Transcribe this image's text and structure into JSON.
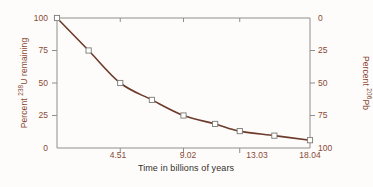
{
  "chart_data": {
    "type": "line",
    "title": "",
    "xlabel": "Time in billions of years",
    "ylabel_left": "Percent 238U remaining",
    "ylabel_right": "Percent 206Pb",
    "x": [
      0,
      2.255,
      4.51,
      6.765,
      9.02,
      11.275,
      13.03,
      15.5,
      18.04
    ],
    "values_u238": [
      100,
      75,
      50,
      37,
      25,
      18.5,
      13,
      9.5,
      6
    ],
    "values_pb206": [
      0,
      25,
      50,
      63,
      75,
      81.5,
      87,
      90.5,
      94
    ],
    "xlim": [
      0,
      18.04
    ],
    "ylim_left": [
      0,
      100
    ],
    "ylim_right": [
      100,
      0
    ],
    "xticks": [
      "4.51",
      "9.02",
      "13.03",
      "18.04"
    ],
    "xtick_values": [
      4.51,
      9.02,
      13.03,
      18.04
    ],
    "yticks_left": [
      "100",
      "75",
      "50",
      "25",
      "0"
    ],
    "ytick_values_left": [
      100,
      75,
      50,
      25,
      0
    ],
    "yticks_right": [
      "0",
      "25",
      "50",
      "75",
      "100"
    ],
    "ytick_values_right": [
      0,
      25,
      50,
      75,
      100
    ],
    "grid": false,
    "legend": "none",
    "marker": "open-square",
    "line_color": "#6d3b2a",
    "marker_fill": "#ffffff",
    "marker_edge": "#7a7a76",
    "axis_color": "#8e8e8a",
    "tick_text_color": "#8a4a36",
    "xlabel_color": "#33302e",
    "background": "#fdfcfa"
  },
  "labels": {
    "x_axis_title": "Time in billions of years",
    "y_left_prefix": "Percent ",
    "y_left_sup": "238",
    "y_left_suffix": "U remaining",
    "y_right_prefix": "Percent ",
    "y_right_sup": "206",
    "y_right_suffix": "Pb",
    "xt0": "4.51",
    "xt1": "9.02",
    "xt2": "13.03",
    "xt3": "18.04",
    "ylt0": "100",
    "ylt1": "75",
    "ylt2": "50",
    "ylt3": "25",
    "ylt4": "0",
    "yrt0": "0",
    "yrt1": "25",
    "yrt2": "50",
    "yrt3": "75",
    "yrt4": "100"
  }
}
